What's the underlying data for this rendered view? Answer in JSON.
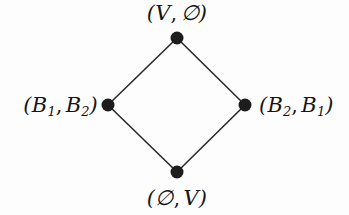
{
  "diagram": {
    "type": "hasse-lattice",
    "title": "",
    "background_color": "#fdfdfd",
    "node_color": "#1d1d1d",
    "edge_color": "#2a2a2a",
    "nodes": [
      {
        "id": "top",
        "label_parts": {
          "open": "(",
          "first": "V",
          "first_sub": "",
          "comma": ",",
          "second": "∅",
          "second_sub": "",
          "close": ")"
        },
        "label_text": "(V, ∅)",
        "x": 177,
        "y": 38
      },
      {
        "id": "left",
        "label_parts": {
          "open": "(",
          "first": "B",
          "first_sub": "1",
          "comma": ",",
          "second": "B",
          "second_sub": "2",
          "close": ")"
        },
        "label_text": "(B1, B2)",
        "x": 108,
        "y": 105
      },
      {
        "id": "right",
        "label_parts": {
          "open": "(",
          "first": "B",
          "first_sub": "2",
          "comma": ",",
          "second": "B",
          "second_sub": "1",
          "close": ")"
        },
        "label_text": "(B2, B1)",
        "x": 245,
        "y": 105
      },
      {
        "id": "bottom",
        "label_parts": {
          "open": "(",
          "first": "∅",
          "first_sub": "",
          "comma": ",",
          "second": "V",
          "second_sub": "",
          "close": ")"
        },
        "label_text": "(∅, V)",
        "x": 177,
        "y": 172
      }
    ],
    "edges": [
      {
        "from": "top",
        "to": "left"
      },
      {
        "from": "top",
        "to": "right"
      },
      {
        "from": "left",
        "to": "bottom"
      },
      {
        "from": "right",
        "to": "bottom"
      }
    ]
  }
}
